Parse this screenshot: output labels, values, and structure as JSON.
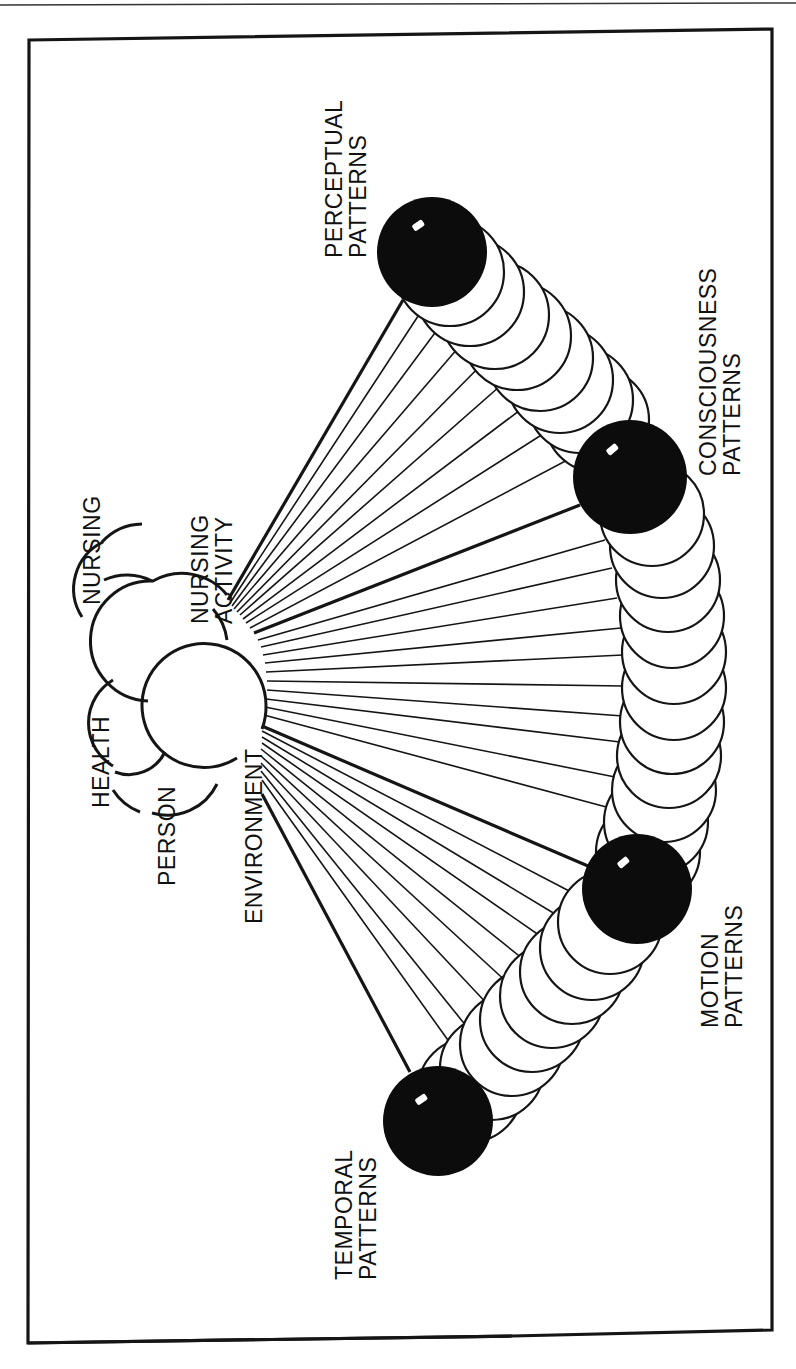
{
  "figure": {
    "orientation": "rotated-90-clockwise",
    "frame_color": "#151515",
    "background": "#ffffff",
    "central_concepts": {
      "nursing": "NURSING",
      "nursing_activity_line1": "NURSING",
      "nursing_activity_line2": "ACTIVITY",
      "health": "HEALTH",
      "person": "PERSON",
      "environment": "ENVIRONMENT"
    },
    "patterns": [
      {
        "id": "perceptual",
        "line1": "PERCEPTUAL",
        "line2": "PATTERNS"
      },
      {
        "id": "consciousness",
        "line1": "CONSCIOUSNESS",
        "line2": "PATTERNS"
      },
      {
        "id": "motion",
        "line1": "MOTION",
        "line2": "PATTERNS"
      },
      {
        "id": "temporal",
        "line1": "TEMPORAL",
        "line2": "PATTERNS"
      }
    ]
  }
}
